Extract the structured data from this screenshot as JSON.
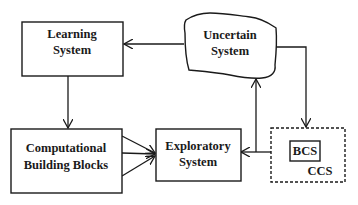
{
  "diagram": {
    "nodes": {
      "learning": {
        "lines": [
          "Learning",
          "System"
        ],
        "shape": "rectangle"
      },
      "uncertain": {
        "lines": [
          "Uncertain",
          "System"
        ],
        "shape": "irregular-blob"
      },
      "computational": {
        "lines": [
          "Computational",
          "Building Blocks"
        ],
        "shape": "rectangle"
      },
      "exploratory": {
        "lines": [
          "Exploratory",
          "System"
        ],
        "shape": "rectangle"
      },
      "ccs": {
        "label": "CCS",
        "shape": "dashed-rectangle"
      },
      "bcs": {
        "label": "BCS",
        "shape": "rectangle"
      }
    },
    "edges": [
      {
        "from": "Uncertain System",
        "to": "Learning System"
      },
      {
        "from": "Learning System",
        "to": "Computational Building Blocks"
      },
      {
        "from": "Computational Building Blocks",
        "to": "Exploratory System",
        "count": 3
      },
      {
        "from": "Exploratory System",
        "to": "Uncertain System"
      },
      {
        "from": "Uncertain System",
        "to": "CCS"
      },
      {
        "from": "CCS",
        "to": "Exploratory System"
      }
    ]
  }
}
